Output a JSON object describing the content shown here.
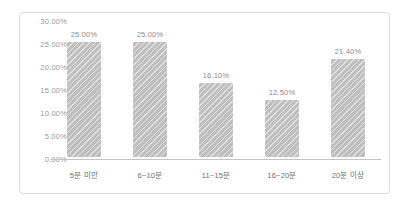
{
  "chart_data": {
    "type": "bar",
    "title": "",
    "subtitle": "",
    "xlabel": "",
    "ylabel": "",
    "ylim": [
      0,
      30
    ],
    "grid": false,
    "legend": null,
    "y_ticks": [
      "0.00%",
      "5.00%",
      "10.00%",
      "15.00%",
      "20.00%",
      "25.00%",
      "30.00%"
    ],
    "y_tick_values": [
      0,
      5,
      10,
      15,
      20,
      25,
      30
    ],
    "categories": [
      "5분 미만",
      "6~10분",
      "11~15분",
      "16~20분",
      "20분 이상"
    ],
    "values": [
      25.0,
      25.0,
      16.1,
      12.5,
      21.4
    ],
    "data_labels": [
      "25.00%",
      "25.00%",
      "16.10%",
      "12.50%",
      "21.40%"
    ],
    "bar_color": "#bfbfbf",
    "axis_color": "#c4c4c4",
    "label_color": "#8c8c8c",
    "tick_color": "#9a9a9a",
    "border_color": "#dcdcdc",
    "background": "#ffffff"
  }
}
